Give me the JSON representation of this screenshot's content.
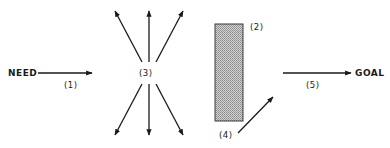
{
  "diagram": {
    "type": "flow",
    "colors": {
      "ink": "#1a1a1a",
      "barrier_fill": "#b8b8b8",
      "background": "#ffffff"
    },
    "nodes": {
      "start": {
        "label": "NEED"
      },
      "end": {
        "label": "GOAL"
      }
    },
    "labels": {
      "step1": "(1)",
      "step2": "(2)",
      "step3": "(3)",
      "step4": "(4)",
      "step5": "(5)"
    },
    "elements": [
      {
        "id": "1",
        "kind": "arrow",
        "from": "NEED",
        "direction": "right"
      },
      {
        "id": "2",
        "kind": "barrier",
        "shape": "hatched-rectangle"
      },
      {
        "id": "3",
        "kind": "radiating-arrows",
        "count": 6,
        "directions": [
          "up-left",
          "up",
          "up-right",
          "down-left",
          "down",
          "down-right"
        ]
      },
      {
        "id": "4",
        "kind": "arrow",
        "direction": "up-right"
      },
      {
        "id": "5",
        "kind": "arrow",
        "to": "GOAL",
        "direction": "right"
      }
    ]
  }
}
